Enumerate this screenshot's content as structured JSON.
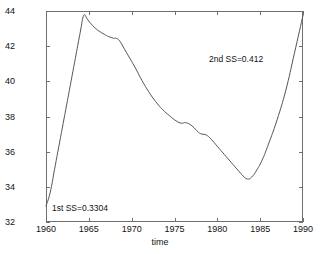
{
  "chart_data": {
    "type": "line",
    "title": "",
    "xlabel": "time",
    "ylabel": "",
    "xlim": [
      1960,
      1990
    ],
    "ylim": [
      32,
      44
    ],
    "grid": false,
    "legend": null,
    "xticks": [
      1960,
      1965,
      1970,
      1975,
      1980,
      1985,
      1990
    ],
    "xticklabels": [
      "1960",
      "1965",
      "1970",
      "1975",
      "1980",
      "1985",
      "1990"
    ],
    "yticks": [
      32,
      34,
      36,
      38,
      40,
      42,
      44
    ],
    "yticklabels": [
      "32",
      "34",
      "36",
      "38",
      "40",
      "42",
      "44"
    ],
    "series": [
      {
        "name": "fitted curve",
        "color": "#555555",
        "x": [
          1960.0,
          1960.5,
          1961.0,
          1961.5,
          1962.0,
          1962.5,
          1963.0,
          1963.5,
          1964.0,
          1964.4,
          1964.8,
          1965.2,
          1965.7,
          1966.2,
          1966.8,
          1967.3,
          1967.9,
          1968.2,
          1968.6,
          1969.2,
          1969.8,
          1970.5,
          1971.2,
          1972.0,
          1972.8,
          1973.6,
          1974.4,
          1975.2,
          1975.8,
          1976.3,
          1976.8,
          1977.3,
          1977.8,
          1978.2,
          1978.7,
          1979.3,
          1980.0,
          1980.8,
          1981.6,
          1982.4,
          1983.0,
          1983.5,
          1984.0,
          1984.6,
          1985.3,
          1986.1,
          1987.0,
          1988.0,
          1989.0,
          1990.0
        ],
        "y": [
          32.9,
          33.7,
          35.0,
          36.3,
          37.6,
          38.9,
          40.2,
          41.5,
          42.8,
          43.75,
          43.55,
          43.3,
          43.05,
          42.85,
          42.68,
          42.55,
          42.45,
          42.45,
          42.3,
          41.8,
          41.3,
          40.7,
          40.05,
          39.4,
          38.85,
          38.4,
          38.05,
          37.75,
          37.62,
          37.65,
          37.55,
          37.35,
          37.1,
          37.0,
          36.95,
          36.7,
          36.3,
          35.85,
          35.4,
          34.95,
          34.62,
          34.45,
          34.55,
          34.95,
          35.6,
          36.6,
          37.85,
          39.5,
          41.6,
          43.75
        ]
      }
    ],
    "annotations": [
      {
        "id": "annot-1",
        "text": "1st SS=0.3304"
      },
      {
        "id": "annot-2",
        "text": "2nd SS=0.412"
      }
    ]
  },
  "axes": {
    "x_title": "time",
    "frame_color": "#6f6f6f"
  }
}
